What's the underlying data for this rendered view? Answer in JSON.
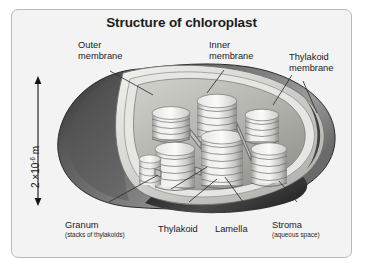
{
  "figure": {
    "title": "Structure of chloroplast",
    "background_color": "#f3f3f3",
    "border_color": "#b9b9b9",
    "text_color": "#1b1b1b"
  },
  "scale": {
    "value": "2 ×10",
    "exponent": "-6",
    "unit": " m",
    "full_text": "2 ×10⁻⁶ m",
    "orientation": "vertical",
    "arrow": "double-headed"
  },
  "labels": [
    {
      "id": "outer-membrane",
      "line1": "Outer",
      "line2": "membrane",
      "sub": ""
    },
    {
      "id": "inner-membrane",
      "line1": "Inner",
      "line2": "membrane",
      "sub": ""
    },
    {
      "id": "thylakoid-membrane",
      "line1": "Thylakoid",
      "line2": "membrane",
      "sub": ""
    },
    {
      "id": "granum",
      "line1": "Granum",
      "line2": "",
      "sub": "(stacks of thylakoids)"
    },
    {
      "id": "thylakoid",
      "line1": "Thylakoid",
      "line2": "",
      "sub": ""
    },
    {
      "id": "lamella",
      "line1": "Lamella",
      "line2": "",
      "sub": ""
    },
    {
      "id": "stroma",
      "line1": "Stroma",
      "line2": "",
      "sub": "(aqueous space)"
    }
  ],
  "diagram": {
    "organelle": "chloroplast",
    "view": "cutaway",
    "colors": {
      "outer_membrane": "#6b6b6b",
      "outer_membrane_shadow": "#3f3f3f",
      "inner_membrane": "#d8d8d4",
      "stroma": "#b4b4b0",
      "thylakoid_light": "#ececea",
      "thylakoid_dark": "#8e8e8c",
      "leader_line": "#3a3a3a"
    },
    "granum_stacks": 7
  }
}
